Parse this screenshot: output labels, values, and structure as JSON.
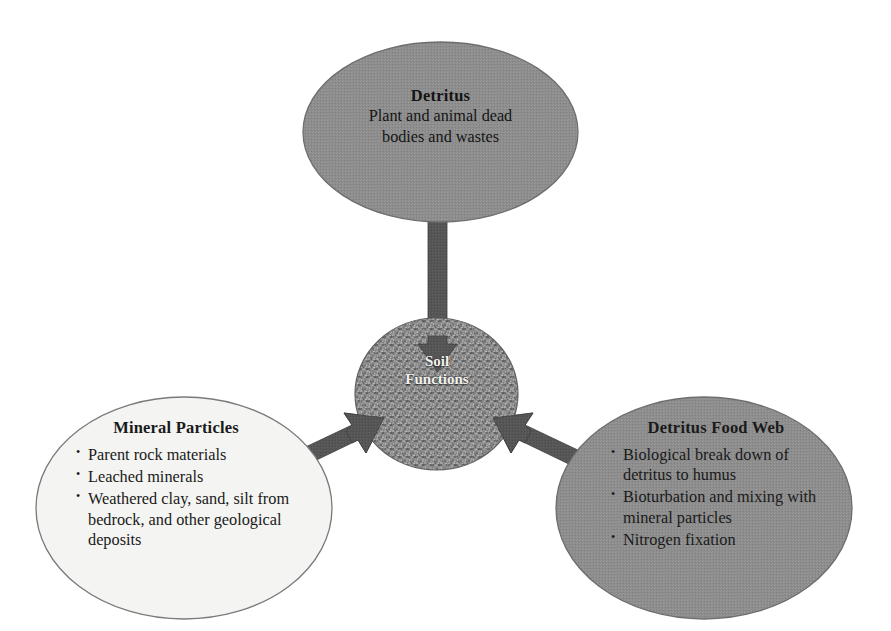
{
  "diagram": {
    "title": "Soil Functions",
    "colors": {
      "background": "#ffffff",
      "ellipse_gray_fill": "#8d8d8d",
      "ellipse_light_fill": "#f4f4f2",
      "ellipse_outline": "#6e6e6e",
      "center_circle_fill": "#8a8a8a",
      "center_circle_outline": "#5f5f5f",
      "arrow_fill": "#565656",
      "text_dark": "#141414",
      "text_light": "#f2f2ee"
    },
    "nodes": {
      "detritus": {
        "title": "Detritus",
        "line1": "Plant and animal dead",
        "line2": "bodies and wastes"
      },
      "soil_functions": {
        "line1": "Soil",
        "line2": "Functions"
      },
      "mineral_particles": {
        "title": "Mineral Particles",
        "bullets": [
          "Parent rock materials",
          "Leached minerals",
          "Weathered clay, sand, silt from bedrock, and other geological deposits"
        ]
      },
      "detritus_food_web": {
        "title": "Detritus Food Web",
        "bullets": [
          "Biological break down of detritus to humus",
          "Bioturbation and mixing with mineral particles",
          "Nitrogen fixation"
        ]
      }
    },
    "arrows": [
      {
        "name": "detritus-to-soil-functions",
        "from": "detritus",
        "to": "soil_functions",
        "direction": "down"
      },
      {
        "name": "mineral-particles-to-soil-functions",
        "from": "mineral_particles",
        "to": "soil_functions",
        "direction": "up-right"
      },
      {
        "name": "detritus-food-web-to-soil-functions",
        "from": "detritus_food_web",
        "to": "soil_functions",
        "direction": "up-left"
      }
    ]
  }
}
